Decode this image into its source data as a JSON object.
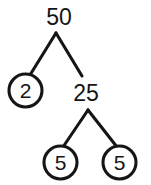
{
  "diagram": {
    "background_color": "#ffffff",
    "stroke_color": "#151515",
    "nodes": [
      {
        "id": "root",
        "label": "50",
        "shape": "plain",
        "cx": 59,
        "cy": 16,
        "r": 0
      },
      {
        "id": "left-child",
        "label": "2",
        "shape": "circled",
        "cx": 25.5,
        "cy": 90.5,
        "r": 16.5
      },
      {
        "id": "right-child",
        "label": "25",
        "shape": "plain",
        "cx": 86,
        "cy": 93,
        "r": 0
      },
      {
        "id": "leaf-left",
        "label": "5",
        "shape": "circled",
        "cx": 60.5,
        "cy": 162.5,
        "r": 16.5
      },
      {
        "id": "leaf-right",
        "label": "5",
        "shape": "circled",
        "cx": 119.5,
        "cy": 162.5,
        "r": 16.5
      }
    ],
    "edges": [
      {
        "id": "edge-root-left",
        "from": "root",
        "to": "left-child",
        "x1": 56,
        "y1": 33,
        "x2": 30,
        "y2": 75
      },
      {
        "id": "edge-root-right",
        "from": "root",
        "to": "right-child",
        "x1": 56,
        "y1": 33,
        "x2": 82,
        "y2": 76
      },
      {
        "id": "edge-right-leafl",
        "from": "right-child",
        "to": "leaf-left",
        "x1": 88,
        "y1": 110,
        "x2": 63,
        "y2": 147
      },
      {
        "id": "edge-right-leafr",
        "from": "right-child",
        "to": "leaf-right",
        "x1": 88,
        "y1": 110,
        "x2": 117,
        "y2": 147
      }
    ]
  }
}
